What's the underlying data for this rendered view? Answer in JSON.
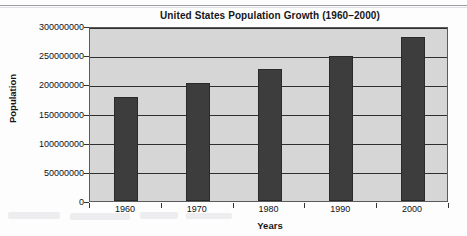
{
  "chart_data": {
    "type": "bar",
    "title": "United States Population Growth (1960–2000)",
    "xlabel": "Years",
    "ylabel": "Population",
    "categories": [
      "1960",
      "1970",
      "1980",
      "1990",
      "2000"
    ],
    "values": [
      179000000,
      203000000,
      227000000,
      249000000,
      281000000
    ],
    "ylim": [
      0,
      300000000
    ],
    "ytick_labels": [
      "300000000",
      "250000000",
      "200000000",
      "150000000",
      "100000000",
      "50000000",
      "0"
    ],
    "ytick_values": [
      300000000,
      250000000,
      200000000,
      150000000,
      100000000,
      50000000,
      0
    ],
    "grid": true,
    "legend": false,
    "colors": {
      "bar_fill": "#3d3d3d",
      "bar_edge": "#2a2a2a",
      "plot_background": "#d6d6d6",
      "gridline": "#2f2f2f",
      "axis_frame": "#5b5b5b",
      "text": "#17171a"
    }
  }
}
